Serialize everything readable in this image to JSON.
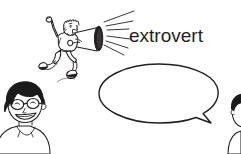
{
  "scene": {
    "width": 241,
    "height": 154,
    "background_color": "#ffffff",
    "ink_color": "#231f20",
    "style": "black-and-white cartoon line drawing"
  },
  "label": {
    "text": "extrovert",
    "color": "#231f20"
  },
  "figures": [
    {
      "name": "shouting-person-with-megaphone",
      "description": "cartoon person jumping with raised fist, holding a megaphone pointed to the right",
      "fill_color": "#ffffff",
      "accent_color": "#231f20"
    },
    {
      "name": "megaphone",
      "description": "cone megaphone with dark bell rim and radiating sound lines",
      "bell_color": "#231f20"
    },
    {
      "name": "speech-bubble",
      "description": "empty oval speech balloon with a pointed tail at the lower right",
      "fill_color": "#ffffff",
      "outline_color": "#231f20"
    },
    {
      "name": "listening-boy",
      "description": "smiling boy with black hair and glasses at the bottom left",
      "hair_color": "#1a1a1a"
    },
    {
      "name": "cropped-person-right",
      "description": "partial head with dark hair cropped at the right edge",
      "hair_color": "#1a1a1a"
    }
  ]
}
